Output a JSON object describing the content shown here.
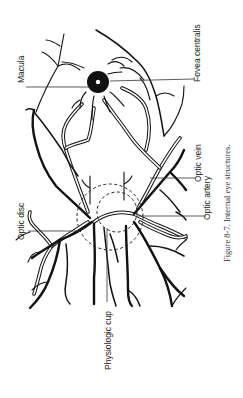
{
  "figure": {
    "caption": "Figure 8-7. Internal eye structures.",
    "labels": {
      "macula": "Macula",
      "fovea_centralis": "Fovea centralis",
      "optic_vein": "Optic vein",
      "optic_artery": "Optic artery",
      "optic_disc": "Optic disc",
      "physiologic_cup": "Physiologic cup"
    },
    "orientation": "rotated 90 degrees clockwise (text reads bottom-to-top)",
    "colors": {
      "ink": "#111111",
      "background": "#ffffff"
    }
  }
}
